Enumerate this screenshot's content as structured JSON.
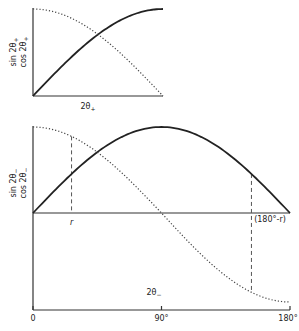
{
  "chart_data": [
    {
      "type": "line",
      "title": "",
      "ylabel": [
        "sin 2θ₊",
        "cos 2θ₊"
      ],
      "xlabel": "2θ₊",
      "xlim": [
        0,
        90
      ],
      "ylim": [
        0,
        1
      ],
      "grid": false,
      "series": [
        {
          "name": "sin 2θ₊",
          "style": "solid",
          "function": "sin",
          "x": [
            0,
            15,
            30,
            45,
            60,
            75,
            90
          ],
          "values": [
            0,
            0.259,
            0.5,
            0.707,
            0.866,
            0.966,
            1.0
          ]
        },
        {
          "name": "cos 2θ₊",
          "style": "dotted",
          "function": "cos",
          "x": [
            0,
            15,
            30,
            45,
            60,
            75,
            90
          ],
          "values": [
            1.0,
            0.966,
            0.866,
            0.707,
            0.5,
            0.259,
            0
          ]
        }
      ]
    },
    {
      "type": "line",
      "title": "",
      "ylabel": [
        "sin 2θ₋",
        "cos 2θ₋"
      ],
      "xlabel": "2θ₋",
      "xlim": [
        0,
        180
      ],
      "ylim": [
        -1,
        1
      ],
      "grid": false,
      "x_ticks": [
        "0",
        "90°",
        "180°"
      ],
      "x_tick_values": [
        0,
        90,
        180
      ],
      "annotations": [
        {
          "label": "r",
          "x": 27
        },
        {
          "label": "(180°-r)",
          "x": 153
        }
      ],
      "series": [
        {
          "name": "sin 2θ₋",
          "style": "solid",
          "function": "sin",
          "x": [
            0,
            30,
            60,
            90,
            120,
            150,
            180
          ],
          "values": [
            0,
            0.5,
            0.866,
            1.0,
            0.866,
            0.5,
            0
          ]
        },
        {
          "name": "cos 2θ₋",
          "style": "dotted",
          "function": "cos",
          "x": [
            0,
            30,
            60,
            90,
            120,
            150,
            180
          ],
          "values": [
            1.0,
            0.866,
            0.5,
            0,
            -0.5,
            -0.866,
            -1.0
          ]
        }
      ]
    }
  ],
  "labels": {
    "upper_y1": "sin 2θ",
    "upper_y2": "cos 2θ",
    "upper_sub": "+",
    "upper_x": "2θ",
    "lower_y1": "sin 2θ",
    "lower_y2": "cos 2θ",
    "lower_sub": "−",
    "lower_x": "2θ",
    "r": "r",
    "r_complement": "(180°-r)",
    "tick_0": "0",
    "tick_90": "90°",
    "tick_180": "180°"
  }
}
